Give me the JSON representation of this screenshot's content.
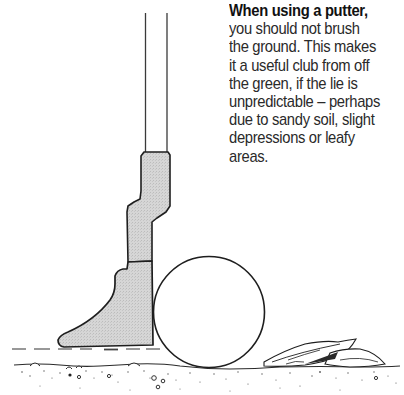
{
  "caption": {
    "lead": "When using a putter,",
    "lines": [
      "you should not brush",
      "the ground. This makes",
      "it a useful club from off",
      "the green, if the lie is",
      "unpredictable – perhaps",
      "due to sandy soil, slight",
      "depressions or leafy",
      "areas."
    ]
  },
  "illustration": {
    "subject": "putter-head-and-golf-ball-above-ground",
    "elements": [
      "putter-shaft",
      "putter-head",
      "golf-ball",
      "leaf",
      "ground-line",
      "dashed-reference-line",
      "soil-speckles"
    ],
    "colors": {
      "ink": "#1e1e1e",
      "club_fill": "#d4d4d4",
      "background": "#ffffff"
    }
  }
}
